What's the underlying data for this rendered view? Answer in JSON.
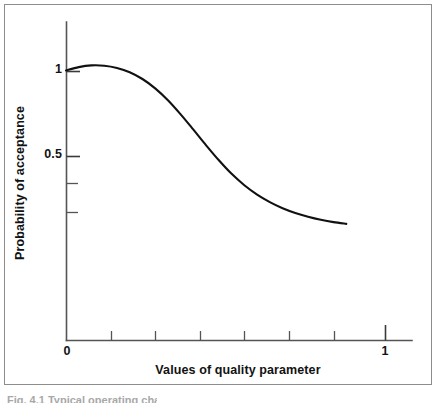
{
  "figure": {
    "background_color": "#ffffff",
    "frame_color": "#8d8d8d",
    "curve_color": "#111111",
    "axis_color": "#555555",
    "text_color": "#121212"
  },
  "axis": {
    "x_title": "Values of quality parameter",
    "y_title": "Probability of acceptance",
    "x_tick_labels": [
      "0",
      "1"
    ],
    "y_tick_labels": [
      "1",
      "0.5"
    ]
  },
  "caption": {
    "clipped_text": "Fig. 4.1 Typical operating characteristic"
  },
  "chart_data": {
    "type": "line",
    "title": "",
    "subtitle": "",
    "xlabel": "Values of quality parameter",
    "ylabel": "Probability of acceptance",
    "xlim": [
      0,
      1.15
    ],
    "ylim": [
      0,
      1.16
    ],
    "grid": false,
    "legend": null,
    "x_ticks_labeled": [
      {
        "value": 0,
        "label": "0"
      },
      {
        "value": 1,
        "label": "1"
      }
    ],
    "x_ticks_unlabeled": [
      0.14,
      0.28,
      0.42,
      0.56,
      0.7,
      0.84
    ],
    "y_ticks_labeled": [
      {
        "value": 1.0,
        "label": "1"
      },
      {
        "value": 0.5,
        "label": "0.5"
      }
    ],
    "y_ticks_unlabeled": [
      0.34,
      0.17
    ],
    "series": [
      {
        "name": "Operating characteristic",
        "x": [
          0.0,
          0.04,
          0.08,
          0.12,
          0.16,
          0.2,
          0.24,
          0.28,
          0.32,
          0.36,
          0.4,
          0.44,
          0.48,
          0.52,
          0.56,
          0.6,
          0.64,
          0.68,
          0.72,
          0.76,
          0.8,
          0.84,
          0.88
        ],
        "y": [
          1.0,
          1.02,
          1.03,
          1.028,
          1.015,
          0.99,
          0.95,
          0.895,
          0.825,
          0.742,
          0.652,
          0.56,
          0.472,
          0.392,
          0.325,
          0.27,
          0.226,
          0.19,
          0.162,
          0.14,
          0.122,
          0.108,
          0.098
        ]
      }
    ],
    "annotations": []
  }
}
